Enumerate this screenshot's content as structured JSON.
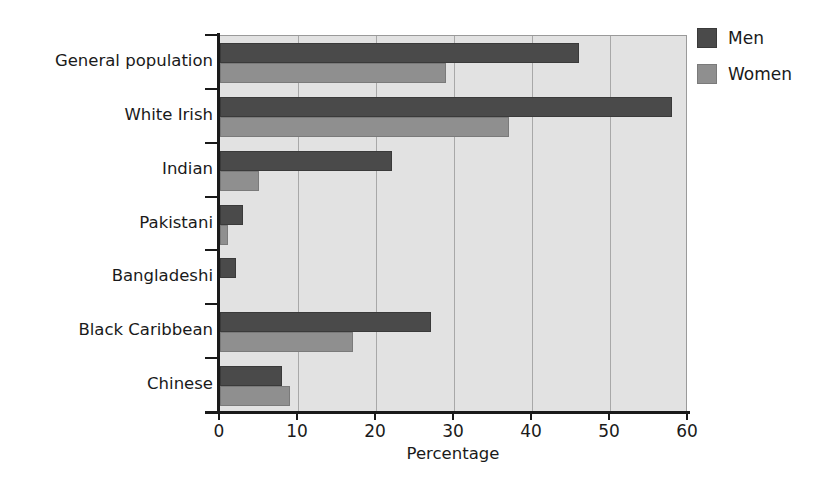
{
  "chart_data": {
    "type": "bar",
    "orientation": "horizontal",
    "title": "",
    "xlabel": "Percentage",
    "ylabel": "",
    "xlim": [
      0,
      60
    ],
    "ylim": null,
    "grid": true,
    "xticks": [
      0,
      10,
      20,
      30,
      40,
      50,
      60
    ],
    "xticklabels": [
      "0",
      "10",
      "20",
      "30",
      "40",
      "50",
      "60"
    ],
    "categories": [
      "General population",
      "White Irish",
      "Indian",
      "Pakistani",
      "Bangladeshi",
      "Black Caribbean",
      "Chinese"
    ],
    "series": [
      {
        "name": "Men",
        "color": "#4a4a4a",
        "values": [
          46,
          58,
          22,
          3,
          2,
          27,
          8
        ]
      },
      {
        "name": "Women",
        "color": "#8f8f8f",
        "values": [
          29,
          37,
          5,
          1,
          0,
          17,
          9
        ]
      }
    ],
    "legend": {
      "position": "right",
      "entries": [
        {
          "label": "Men",
          "color": "#4a4a4a"
        },
        {
          "label": "Women",
          "color": "#8f8f8f"
        }
      ]
    },
    "plot_background": "#e2e2e2",
    "axis_color": "#1a1a1a"
  }
}
